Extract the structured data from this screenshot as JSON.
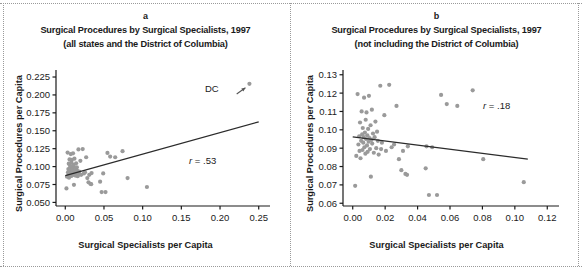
{
  "figure": {
    "background": "#ffffff",
    "point_color": "#9a9a9a",
    "line_color": "#2b2b2b",
    "axis_color": "#1a1a1a"
  },
  "panels": [
    {
      "letter": "a",
      "title": "Surgical Procedures by Surgical Specialists, 1997",
      "subtitle": "(all states and the District of Columbia)",
      "xlabel": "Surgical Specialists per Capita",
      "ylabel": "Surgical Procedures per Capita",
      "annotation_r": "r = .53",
      "annotation_point": "DC"
    },
    {
      "letter": "b",
      "title": "Surgical Procedures by Surgical Specialists, 1997",
      "subtitle": "(not including the District of Columbia)",
      "xlabel": "Surgical Specialists per Capita",
      "ylabel": "Surgical Procedures per Capita",
      "annotation_r": "r = .18",
      "annotation_point": ""
    }
  ],
  "chart_data": [
    {
      "type": "scatter",
      "panel": "a",
      "title": "Surgical Procedures by Surgical Specialists, 1997",
      "subtitle": "(all states and the District of Columbia)",
      "xlabel": "Surgical Specialists per Capita",
      "ylabel": "Surgical Procedures per Capita",
      "xlim": [
        -0.012,
        0.262
      ],
      "ylim": [
        0.045,
        0.232
      ],
      "xticks": [
        0.0,
        0.05,
        0.1,
        0.15,
        0.2,
        0.25
      ],
      "xticklabels": [
        "0.00",
        "0.05",
        "0.10",
        "0.15",
        "0.20",
        "0.25"
      ],
      "yticks": [
        0.05,
        0.075,
        0.1,
        0.125,
        0.15,
        0.175,
        0.2,
        0.225
      ],
      "yticklabels": [
        "0.050",
        "0.075",
        "0.100",
        "0.125",
        "0.150",
        "0.175",
        "0.200",
        "0.225"
      ],
      "grid": false,
      "legend": "none",
      "correlation": 0.53,
      "correlation_label": "r = .53",
      "annotations": [
        {
          "text": "DC",
          "x": 0.206,
          "y": 0.2,
          "arrow_to_x": 0.238,
          "arrow_to_y": 0.2155
        }
      ],
      "trendline": {
        "x": [
          0.0,
          0.25
        ],
        "y": [
          0.0875,
          0.1625
        ]
      },
      "points": [
        {
          "x": 0.0015,
          "y": 0.0695
        },
        {
          "x": 0.0022,
          "y": 0.0858
        },
        {
          "x": 0.003,
          "y": 0.1195
        },
        {
          "x": 0.0035,
          "y": 0.092
        },
        {
          "x": 0.004,
          "y": 0.0965
        },
        {
          "x": 0.0042,
          "y": 0.0885
        },
        {
          "x": 0.0045,
          "y": 0.104
        },
        {
          "x": 0.0048,
          "y": 0.0845
        },
        {
          "x": 0.0052,
          "y": 0.094
        },
        {
          "x": 0.0055,
          "y": 0.11
        },
        {
          "x": 0.0058,
          "y": 0.0975
        },
        {
          "x": 0.006,
          "y": 0.089
        },
        {
          "x": 0.0062,
          "y": 0.101
        },
        {
          "x": 0.0065,
          "y": 0.093
        },
        {
          "x": 0.0068,
          "y": 0.096
        },
        {
          "x": 0.007,
          "y": 0.1175
        },
        {
          "x": 0.0072,
          "y": 0.0905
        },
        {
          "x": 0.0075,
          "y": 0.0985
        },
        {
          "x": 0.0078,
          "y": 0.087
        },
        {
          "x": 0.008,
          "y": 0.1055
        },
        {
          "x": 0.0082,
          "y": 0.095
        },
        {
          "x": 0.0085,
          "y": 0.1095
        },
        {
          "x": 0.0088,
          "y": 0.0915
        },
        {
          "x": 0.009,
          "y": 0.097
        },
        {
          "x": 0.0092,
          "y": 0.088
        },
        {
          "x": 0.0095,
          "y": 0.1005
        },
        {
          "x": 0.0098,
          "y": 0.0935
        },
        {
          "x": 0.01,
          "y": 0.1185
        },
        {
          "x": 0.0103,
          "y": 0.0955
        },
        {
          "x": 0.0106,
          "y": 0.0895
        },
        {
          "x": 0.011,
          "y": 0.1025
        },
        {
          "x": 0.0112,
          "y": 0.0745
        },
        {
          "x": 0.0115,
          "y": 0.0945
        },
        {
          "x": 0.0118,
          "y": 0.111
        },
        {
          "x": 0.012,
          "y": 0.0925
        },
        {
          "x": 0.0125,
          "y": 0.098
        },
        {
          "x": 0.013,
          "y": 0.0875
        },
        {
          "x": 0.0135,
          "y": 0.096
        },
        {
          "x": 0.014,
          "y": 0.1045
        },
        {
          "x": 0.0145,
          "y": 0.09
        },
        {
          "x": 0.015,
          "y": 0.099
        },
        {
          "x": 0.0155,
          "y": 0.094
        },
        {
          "x": 0.016,
          "y": 0.0865
        },
        {
          "x": 0.017,
          "y": 0.124
        },
        {
          "x": 0.0175,
          "y": 0.0895
        },
        {
          "x": 0.018,
          "y": 0.093
        },
        {
          "x": 0.0195,
          "y": 0.108
        },
        {
          "x": 0.0205,
          "y": 0.0885
        },
        {
          "x": 0.0225,
          "y": 0.1245
        },
        {
          "x": 0.024,
          "y": 0.0905
        },
        {
          "x": 0.0255,
          "y": 0.092
        },
        {
          "x": 0.027,
          "y": 0.113
        },
        {
          "x": 0.0285,
          "y": 0.084
        },
        {
          "x": 0.03,
          "y": 0.078
        },
        {
          "x": 0.031,
          "y": 0.0885
        },
        {
          "x": 0.0325,
          "y": 0.076
        },
        {
          "x": 0.0335,
          "y": 0.0755
        },
        {
          "x": 0.034,
          "y": 0.091
        },
        {
          "x": 0.045,
          "y": 0.079
        },
        {
          "x": 0.047,
          "y": 0.0645
        },
        {
          "x": 0.049,
          "y": 0.0905
        },
        {
          "x": 0.052,
          "y": 0.0645
        },
        {
          "x": 0.0545,
          "y": 0.119
        },
        {
          "x": 0.058,
          "y": 0.114
        },
        {
          "x": 0.0645,
          "y": 0.113
        },
        {
          "x": 0.074,
          "y": 0.1215
        },
        {
          "x": 0.0805,
          "y": 0.084
        },
        {
          "x": 0.1055,
          "y": 0.0715
        },
        {
          "x": 0.238,
          "y": 0.2155
        }
      ]
    },
    {
      "type": "scatter",
      "panel": "b",
      "title": "Surgical Procedures by Surgical Specialists, 1997",
      "subtitle": "(not including the District of Columbia)",
      "xlabel": "Surgical Specialists per Capita",
      "ylabel": "Surgical Procedures per Capita",
      "xlim": [
        -0.006,
        0.126
      ],
      "ylim": [
        0.0585,
        0.1315
      ],
      "xticks": [
        0.0,
        0.02,
        0.04,
        0.06,
        0.08,
        0.1,
        0.12
      ],
      "xticklabels": [
        "0.00",
        "0.02",
        "0.04",
        "0.06",
        "0.08",
        "0.10",
        "0.12"
      ],
      "yticks": [
        0.06,
        0.07,
        0.08,
        0.09,
        0.1,
        0.11,
        0.12,
        0.13
      ],
      "yticklabels": [
        "0.06",
        "0.07",
        "0.08",
        "0.09",
        "0.10",
        "0.11",
        "0.12",
        "0.13"
      ],
      "grid": false,
      "legend": "none",
      "correlation": 0.18,
      "correlation_label": "r = .18",
      "annotations": [],
      "trendline": {
        "x": [
          0.0,
          0.108
        ],
        "y": [
          0.0962,
          0.084
        ]
      },
      "points": [
        {
          "x": 0.0015,
          "y": 0.0695
        },
        {
          "x": 0.0022,
          "y": 0.0858
        },
        {
          "x": 0.003,
          "y": 0.1195
        },
        {
          "x": 0.0035,
          "y": 0.092
        },
        {
          "x": 0.004,
          "y": 0.0965
        },
        {
          "x": 0.0042,
          "y": 0.0885
        },
        {
          "x": 0.0045,
          "y": 0.104
        },
        {
          "x": 0.0048,
          "y": 0.0845
        },
        {
          "x": 0.0052,
          "y": 0.094
        },
        {
          "x": 0.0055,
          "y": 0.11
        },
        {
          "x": 0.0058,
          "y": 0.0975
        },
        {
          "x": 0.006,
          "y": 0.089
        },
        {
          "x": 0.0062,
          "y": 0.101
        },
        {
          "x": 0.0065,
          "y": 0.093
        },
        {
          "x": 0.0068,
          "y": 0.096
        },
        {
          "x": 0.007,
          "y": 0.1175
        },
        {
          "x": 0.0072,
          "y": 0.0905
        },
        {
          "x": 0.0075,
          "y": 0.0985
        },
        {
          "x": 0.0078,
          "y": 0.087
        },
        {
          "x": 0.008,
          "y": 0.1055
        },
        {
          "x": 0.0082,
          "y": 0.095
        },
        {
          "x": 0.0085,
          "y": 0.1095
        },
        {
          "x": 0.0088,
          "y": 0.0915
        },
        {
          "x": 0.009,
          "y": 0.097
        },
        {
          "x": 0.0092,
          "y": 0.088
        },
        {
          "x": 0.0095,
          "y": 0.1005
        },
        {
          "x": 0.0098,
          "y": 0.0935
        },
        {
          "x": 0.01,
          "y": 0.1185
        },
        {
          "x": 0.0103,
          "y": 0.0955
        },
        {
          "x": 0.0106,
          "y": 0.0895
        },
        {
          "x": 0.011,
          "y": 0.1025
        },
        {
          "x": 0.0112,
          "y": 0.0745
        },
        {
          "x": 0.0115,
          "y": 0.0945
        },
        {
          "x": 0.0118,
          "y": 0.111
        },
        {
          "x": 0.012,
          "y": 0.0925
        },
        {
          "x": 0.0125,
          "y": 0.098
        },
        {
          "x": 0.013,
          "y": 0.0875
        },
        {
          "x": 0.0135,
          "y": 0.096
        },
        {
          "x": 0.014,
          "y": 0.1045
        },
        {
          "x": 0.0145,
          "y": 0.09
        },
        {
          "x": 0.015,
          "y": 0.099
        },
        {
          "x": 0.0155,
          "y": 0.094
        },
        {
          "x": 0.016,
          "y": 0.0865
        },
        {
          "x": 0.017,
          "y": 0.124
        },
        {
          "x": 0.0175,
          "y": 0.0895
        },
        {
          "x": 0.018,
          "y": 0.093
        },
        {
          "x": 0.0195,
          "y": 0.108
        },
        {
          "x": 0.0205,
          "y": 0.0885
        },
        {
          "x": 0.0225,
          "y": 0.1245
        },
        {
          "x": 0.024,
          "y": 0.0905
        },
        {
          "x": 0.0255,
          "y": 0.092
        },
        {
          "x": 0.027,
          "y": 0.113
        },
        {
          "x": 0.0285,
          "y": 0.084
        },
        {
          "x": 0.03,
          "y": 0.078
        },
        {
          "x": 0.031,
          "y": 0.0885
        },
        {
          "x": 0.0325,
          "y": 0.076
        },
        {
          "x": 0.0335,
          "y": 0.0755
        },
        {
          "x": 0.034,
          "y": 0.091
        },
        {
          "x": 0.045,
          "y": 0.079
        },
        {
          "x": 0.0455,
          "y": 0.091
        },
        {
          "x": 0.047,
          "y": 0.0645
        },
        {
          "x": 0.049,
          "y": 0.0905
        },
        {
          "x": 0.052,
          "y": 0.0645
        },
        {
          "x": 0.0545,
          "y": 0.119
        },
        {
          "x": 0.058,
          "y": 0.114
        },
        {
          "x": 0.0645,
          "y": 0.113
        },
        {
          "x": 0.074,
          "y": 0.1215
        },
        {
          "x": 0.0805,
          "y": 0.084
        },
        {
          "x": 0.1055,
          "y": 0.0715
        }
      ]
    }
  ]
}
